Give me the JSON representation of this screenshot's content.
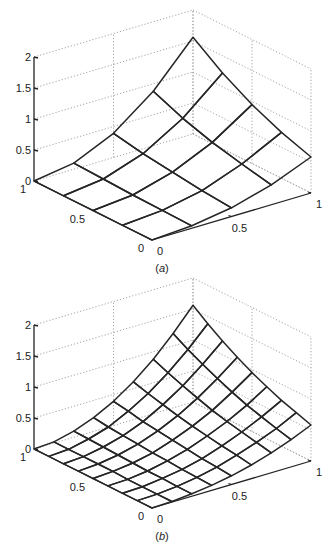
{
  "chart_data": [
    {
      "type": "surface",
      "title": "",
      "caption": {
        "open": "(",
        "letter": "a",
        "close": ")"
      },
      "xlabel": "",
      "ylabel": "",
      "zlabel": "",
      "x_range": [
        0,
        1
      ],
      "y_range": [
        0,
        1
      ],
      "zlim": [
        0,
        2
      ],
      "grid": true,
      "x_ticks": [
        "0",
        "0.5",
        "1"
      ],
      "y_ticks": [
        "0",
        "0.5",
        "1"
      ],
      "z_ticks": [
        "0",
        "0.5",
        "1",
        "1.5",
        "2"
      ],
      "x": [
        0,
        0.25,
        0.5,
        0.75,
        1
      ],
      "y": [
        0,
        0.25,
        0.5,
        0.75,
        1
      ],
      "z_note": "estimated node heights, z[iy][ix]",
      "z": [
        [
          0,
          0.04,
          0.14,
          0.32,
          0.58
        ],
        [
          0,
          0.05,
          0.18,
          0.42,
          0.74
        ],
        [
          0,
          0.06,
          0.24,
          0.53,
          0.95
        ],
        [
          0,
          0.08,
          0.3,
          0.68,
          1.22
        ],
        [
          0,
          0.1,
          0.39,
          0.88,
          1.56
        ]
      ]
    },
    {
      "type": "surface",
      "title": "",
      "caption": {
        "open": "(",
        "letter": "b",
        "close": ")"
      },
      "xlabel": "",
      "ylabel": "",
      "zlabel": "",
      "x_range": [
        0,
        1
      ],
      "y_range": [
        0,
        1
      ],
      "zlim": [
        0,
        2
      ],
      "grid": true,
      "x_ticks": [
        "0",
        "0.5",
        "1"
      ],
      "y_ticks": [
        "0",
        "0.5",
        "1"
      ],
      "z_ticks": [
        "0",
        "0.5",
        "1",
        "1.5",
        "2"
      ],
      "x": [
        0,
        0.125,
        0.25,
        0.375,
        0.5,
        0.625,
        0.75,
        0.875,
        1
      ],
      "y": [
        0,
        0.125,
        0.25,
        0.375,
        0.5,
        0.625,
        0.75,
        0.875,
        1
      ],
      "z_note": "estimated node heights, z[iy][ix]",
      "z": [
        [
          0,
          0.01,
          0.04,
          0.08,
          0.14,
          0.22,
          0.32,
          0.44,
          0.58
        ],
        [
          0,
          0.01,
          0.04,
          0.09,
          0.16,
          0.26,
          0.37,
          0.5,
          0.66
        ],
        [
          0,
          0.01,
          0.05,
          0.1,
          0.18,
          0.29,
          0.42,
          0.57,
          0.74
        ],
        [
          0,
          0.01,
          0.05,
          0.12,
          0.21,
          0.33,
          0.47,
          0.64,
          0.84
        ],
        [
          0,
          0.02,
          0.06,
          0.13,
          0.24,
          0.37,
          0.53,
          0.73,
          0.95
        ],
        [
          0,
          0.02,
          0.07,
          0.15,
          0.27,
          0.42,
          0.61,
          0.83,
          1.08
        ],
        [
          0,
          0.02,
          0.08,
          0.17,
          0.3,
          0.48,
          0.69,
          0.94,
          1.22
        ],
        [
          0,
          0.02,
          0.09,
          0.19,
          0.35,
          0.54,
          0.78,
          1.06,
          1.38
        ],
        [
          0,
          0.02,
          0.1,
          0.22,
          0.39,
          0.61,
          0.88,
          1.2,
          1.56
        ]
      ]
    }
  ]
}
